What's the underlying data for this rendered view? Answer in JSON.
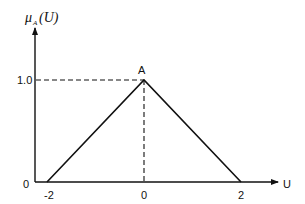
{
  "chart_data": {
    "type": "line",
    "title": "",
    "ylabel_main": "μ",
    "ylabel_sub": "A",
    "ylabel_arg": "(U)",
    "xlabel": "U",
    "x_ticks": [
      "-2",
      "0",
      "2"
    ],
    "y_ticks": [
      "1.0"
    ],
    "origin_label": "0",
    "peak_label": "A",
    "series": [
      {
        "name": "membership",
        "x": [
          -2,
          0,
          2
        ],
        "y": [
          0,
          1,
          0
        ]
      }
    ],
    "xlim": [
      -2.4,
      3.5
    ],
    "ylim": [
      0,
      1.6
    ],
    "guides": "dashed lines from peak to axes"
  }
}
